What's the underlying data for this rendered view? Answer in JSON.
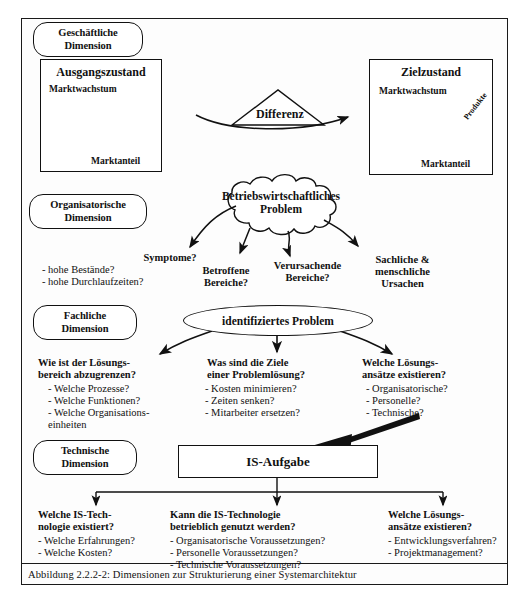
{
  "figure": {
    "caption": "Abbildung 2.2.2-2: Dimensionen zur Strukturierung einer Systemarchitektur"
  },
  "colors": {
    "stroke": "#111111",
    "background": "#ffffff",
    "bubble_fill": "#b5b5b5"
  },
  "dimensions": [
    {
      "id": "geschaeftliche",
      "label": "Geschäftliche\nDimension"
    },
    {
      "id": "organisatorische",
      "label": "Organisatorische\nDimension"
    },
    {
      "id": "fachliche",
      "label": "Fachliche\nDimension"
    },
    {
      "id": "technische",
      "label": "Technische\nDimension"
    }
  ],
  "business_layer": {
    "left_chart": {
      "title": "Ausgangszustand",
      "y_axis": "Marktwachstum",
      "x_axis": "Marktanteil"
    },
    "right_chart": {
      "title": "Zielzustand",
      "y_axis": "Marktwachstum",
      "x_axis": "Marktanteil",
      "annotation": "Produkte"
    },
    "difference_shape": "Differenz"
  },
  "organisational_layer": {
    "cloud": "Betriebswirtschaftliches\nProblem",
    "branches": [
      {
        "heading": "Symptome?",
        "items": [
          "- hohe Bestände?",
          "- hohe Durchlaufzeiten?"
        ]
      },
      {
        "heading": "Betroffene\nBereiche?",
        "items": []
      },
      {
        "heading": "Verursachende\nBereiche?",
        "items": []
      },
      {
        "heading": "Sachliche &\nmenschliche\nUrsachen",
        "items": []
      }
    ]
  },
  "functional_layer": {
    "node": "identifiziertes Problem",
    "branches": [
      {
        "heading": "Wie ist der Lösungs-\nbereich abzugrenzen?",
        "items": [
          "- Welche Prozesse?",
          "- Welche Funktionen?",
          "- Welche Organisations-",
          "   einheiten"
        ]
      },
      {
        "heading": "Was sind die Ziele\neiner Problemlösung?",
        "items": [
          "- Kosten minimieren?",
          "- Zeiten senken?",
          "- Mitarbeiter ersetzen?"
        ]
      },
      {
        "heading": "Welche Lösungs-\nansätze existieren?",
        "items": [
          "- Organisatorische?",
          "- Personelle?",
          "- Technische?"
        ]
      }
    ]
  },
  "technical_layer": {
    "node": "IS-Aufgabe",
    "branches": [
      {
        "heading": "Welche IS-Tech-\nnologie existiert?",
        "items": [
          "- Welche Erfahrungen?",
          "- Welche Kosten?"
        ]
      },
      {
        "heading": "Kann die IS-Technologie\nbetrieblich genutzt werden?",
        "items": [
          "- Organisatorische Voraussetzungen?",
          "- Personelle Voraussetzungen?",
          "- Technische Voraussetzungen?"
        ]
      },
      {
        "heading": "Welche Lösungs-\nansätze existieren?",
        "items": [
          "- Entwicklungsverfahren?",
          "- Projektmanagement?"
        ]
      }
    ]
  }
}
